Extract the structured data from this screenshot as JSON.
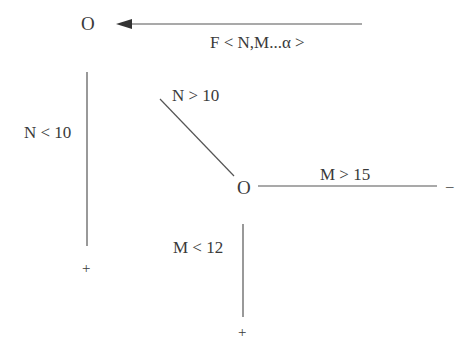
{
  "diagram": {
    "top": {
      "node_label": "O",
      "arrow_label": "F < N,M...α >"
    },
    "left_branch": {
      "label": "N < 10",
      "end_sign": "+"
    },
    "diagonal_branch": {
      "label": "N > 10"
    },
    "center_node": {
      "label": "O"
    },
    "right_branch": {
      "label": "M > 15",
      "end_sign": "–"
    },
    "down_branch": {
      "label": "M < 12",
      "end_sign": "+"
    },
    "colors": {
      "line": "#555555",
      "text": "#3a3a3a",
      "background": "#ffffff"
    }
  }
}
